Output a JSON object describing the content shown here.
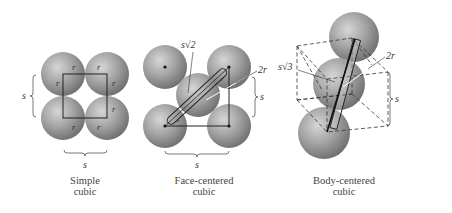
{
  "diagram": {
    "panels": [
      {
        "id": "simple",
        "caption_line1": "Simple",
        "caption_line2": "cubic",
        "edge_label": "s",
        "radius_label": "r",
        "side_label": "s"
      },
      {
        "id": "face-centered",
        "caption_line1": "Face-centered",
        "caption_line2": "cubic",
        "edge_label": "s",
        "side_label": "s",
        "diagonal_label": "s√2",
        "diameter_label": "2r",
        "radius_label": "r"
      },
      {
        "id": "body-centered",
        "caption_line1": "Body-centered",
        "caption_line2": "cubic",
        "side_label": "s",
        "diagonal_label": "s√3",
        "diameter_label": "2r"
      }
    ],
    "colors": {
      "sphere_light": "#c8c8c8",
      "sphere_mid": "#9a9a9a",
      "sphere_dark": "#6e6e6e",
      "line": "#222222",
      "bracket": "#555555"
    }
  }
}
